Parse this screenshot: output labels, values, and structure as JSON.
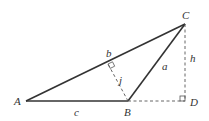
{
  "diagram": {
    "type": "triangle-geometry",
    "vertices": {
      "A": {
        "label": "A"
      },
      "B": {
        "label": "B"
      },
      "C": {
        "label": "C"
      },
      "D": {
        "label": "D"
      }
    },
    "sides": {
      "a": {
        "label": "a"
      },
      "b": {
        "label": "b"
      },
      "c": {
        "label": "c"
      }
    },
    "heights": {
      "h": {
        "label": "h"
      },
      "j": {
        "label": "j"
      }
    },
    "colors": {
      "line": "#333333",
      "background": "#ffffff"
    }
  }
}
